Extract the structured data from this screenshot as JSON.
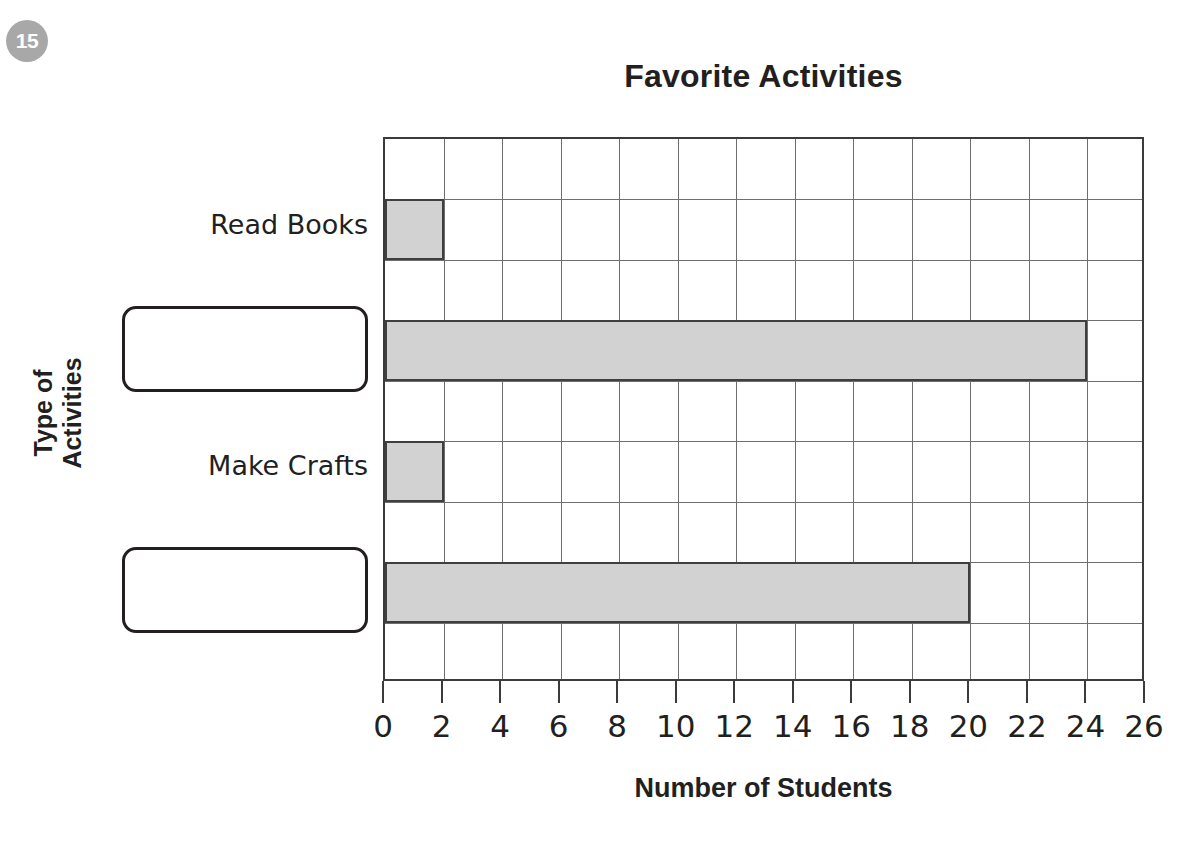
{
  "question": {
    "number": "15"
  },
  "chart_data": {
    "type": "bar",
    "orientation": "horizontal",
    "title": "Favorite Activities",
    "xlabel": "Number of Students",
    "ylabel": "Type of Activities",
    "xlim": [
      0,
      26
    ],
    "xticks": [
      "0",
      "2",
      "4",
      "6",
      "8",
      "10",
      "12",
      "14",
      "16",
      "18",
      "20",
      "22",
      "24",
      "26"
    ],
    "grid": true,
    "legend": "none",
    "categories": [
      {
        "label": "Read Books",
        "value": 2,
        "row": 1,
        "blank": false
      },
      {
        "label": "",
        "value": 24,
        "row": 3,
        "blank": true
      },
      {
        "label": "Make Crafts",
        "value": 2,
        "row": 5,
        "blank": false
      },
      {
        "label": "",
        "value": 20,
        "row": 7,
        "blank": true
      }
    ],
    "values": [
      2,
      24,
      2,
      20
    ],
    "colors": {
      "bar_fill": "#d2d2d2",
      "bar_stroke": "#3f3f3f",
      "grid_line": "#6e6e6e",
      "axis": "#3b3b3b",
      "text": "#231f20",
      "badge": "#a8a8a8"
    }
  }
}
